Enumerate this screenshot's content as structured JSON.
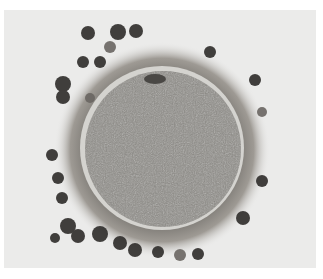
{
  "image": {
    "subject": "micrograph of oocyte surrounded by zona pellucida and cumulus cells",
    "background_color": "#ebebea",
    "border_color": "#ffffff",
    "cell": {
      "center": [
        162,
        148
      ],
      "ooplasm_radius": 78,
      "zona_radius": 82,
      "corona_radius": 106,
      "ooplasm_color": "#8a8a86",
      "zona_color": "#d8d8d4",
      "corona_color": "#9a9690"
    },
    "granulosa_cells": [
      [
        88,
        33,
        7
      ],
      [
        118,
        32,
        8
      ],
      [
        136,
        31,
        7
      ],
      [
        110,
        47,
        6
      ],
      [
        83,
        62,
        6
      ],
      [
        100,
        62,
        6
      ],
      [
        63,
        84,
        8
      ],
      [
        63,
        97,
        7
      ],
      [
        210,
        52,
        6
      ],
      [
        255,
        80,
        6
      ],
      [
        262,
        112,
        5
      ],
      [
        52,
        155,
        6
      ],
      [
        58,
        178,
        6
      ],
      [
        62,
        198,
        6
      ],
      [
        68,
        226,
        8
      ],
      [
        78,
        236,
        7
      ],
      [
        100,
        234,
        8
      ],
      [
        120,
        243,
        7
      ],
      [
        135,
        250,
        7
      ],
      [
        158,
        252,
        6
      ],
      [
        180,
        255,
        6
      ],
      [
        198,
        254,
        6
      ],
      [
        243,
        218,
        7
      ],
      [
        262,
        181,
        6
      ],
      [
        55,
        238,
        5
      ],
      [
        155,
        82,
        6
      ]
    ]
  }
}
